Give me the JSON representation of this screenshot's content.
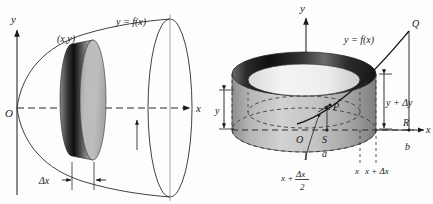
{
  "figure": {
    "kind": "calculus-volume-of-revolution-illustration",
    "panels": [
      {
        "id": "left-panel",
        "name": "disk-method-solid-of-revolution",
        "axes": {
          "y_label": "y",
          "x_label": "x",
          "origin_label": "O"
        },
        "labels": {
          "curve": "y = f(x)",
          "point": "(x,y)",
          "thickness": "Δx"
        }
      },
      {
        "id": "right-panel",
        "name": "shell-method-cylindrical-shell",
        "axes": {
          "y_label": "y",
          "x_label": "x",
          "origin_label": "O"
        },
        "labels": {
          "curve": "y = f(x)",
          "point_q": "Q",
          "point_p": "P",
          "point_r": "R",
          "point_s": "S",
          "height_y": "y",
          "height_y_dy": "y + Δy",
          "limit_a": "a",
          "limit_b": "b",
          "tick_x": "x",
          "tick_x_dx": "x + Δx",
          "midpoint_num": "x +",
          "midpoint_frac_top": "Δx",
          "midpoint_frac_bottom": "2"
        }
      }
    ],
    "colors": {
      "ink": "#1a1a1a",
      "line": "#2b2b2b",
      "disk_face": "#b9b9b9",
      "disk_edge_dark": "#242424",
      "shell_light": "#cfcfcf",
      "shell_mid": "#9e9e9e",
      "shell_dark": "#1f1f1f",
      "shell_inner": "#e9e9e9",
      "background": "#fdfdfd"
    }
  }
}
